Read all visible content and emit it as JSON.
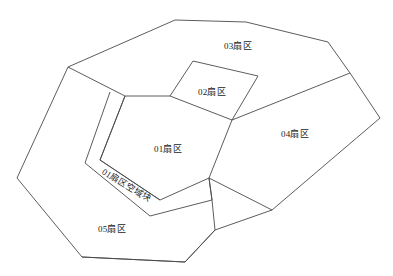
{
  "diagram": {
    "background_color": "#ffffff",
    "line_color": "#4a4a4a",
    "text_color": "#1a1a1a",
    "width": 393,
    "height": 276,
    "regions": [
      {
        "id": "sector-03",
        "label": "03扇区",
        "label_x": 238,
        "label_y": 47,
        "rotation": 0,
        "points": "68,67 175,20 246,22 328,42 350,73 232,120 193,61 170,96 125,96"
      },
      {
        "id": "sector-02",
        "label": "02扇区",
        "label_x": 212,
        "label_y": 93,
        "rotation": 0,
        "points": "193,61 170,96 232,120 258,76"
      },
      {
        "id": "sector-04",
        "label": "04扇区",
        "label_x": 295,
        "label_y": 135,
        "rotation": 0,
        "points": "350,73 380,118 272,210 209,178 232,120"
      },
      {
        "id": "sector-01",
        "label": "01扇区",
        "label_x": 168,
        "label_y": 150,
        "rotation": 0,
        "points": "125,96 170,96 232,120 209,178 160,200 100,160"
      },
      {
        "id": "sector-01-airspace-block",
        "label": "01扇区空域块",
        "label_x": 126,
        "label_y": 186,
        "rotation": 31,
        "points": "110,92 85,163 150,216 212,200 209,178 160,200 100,160 125,96"
      },
      {
        "id": "sector-05",
        "label": "05扇区",
        "label_x": 112,
        "label_y": 230,
        "rotation": 0,
        "points": "68,67 17,178 82,257 185,262 215,230 212,200 150,216 85,163 110,92"
      }
    ],
    "paths": [
      {
        "id": "outer-boundary",
        "d": "M 68,67 L 175,20 L 246,22 L 328,42 L 350,73 L 380,118 L 272,210 L 215,230 L 185,262 L 82,257 L 17,178 Z"
      },
      {
        "id": "sector-03-south-edge",
        "d": "M 68,67 L 125,96 L 170,96 L 232,120 L 350,73"
      },
      {
        "id": "sector-02-boundary",
        "d": "M 193,61 L 170,96 M 193,61 L 258,76 L 232,120"
      },
      {
        "id": "sector-01-boundary",
        "d": "M 125,96 L 100,160 L 160,200 L 209,178 L 232,120"
      },
      {
        "id": "sector-04-west-edge",
        "d": "M 209,178 L 272,210"
      },
      {
        "id": "airspace-block-outer",
        "d": "M 110,92 L 85,163 L 150,216 L 212,200 L 209,178"
      },
      {
        "id": "airspace-block-inner",
        "d": "M 125,96 L 100,160 L 160,200"
      },
      {
        "id": "sector-05-inner-edge",
        "d": "M 212,200 L 215,230 M 209,178 L 212,200"
      },
      {
        "id": "sector-05-bottom-edge",
        "d": "M 82,257 L 185,262 L 215,230"
      }
    ]
  }
}
